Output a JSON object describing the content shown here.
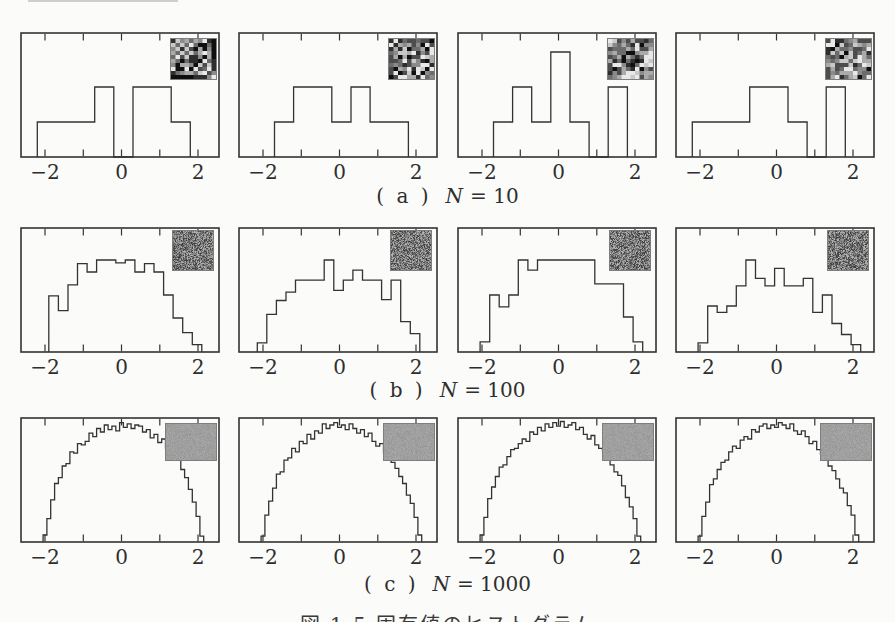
{
  "figure": {
    "paper_color": "#fbfbf9",
    "ink_color": "#333333",
    "bottom_caption": "図 1.5 固有値のヒストグラム"
  },
  "axis": {
    "x0_px": 101.5,
    "px_per_unit": 38.25,
    "ticks": [
      -2,
      -1,
      0,
      1,
      2
    ],
    "tick_labels": [
      {
        "value": -2,
        "text": "−2"
      },
      {
        "value": 0,
        "text": "0"
      },
      {
        "value": 2,
        "text": "2"
      }
    ],
    "xlim": [
      -2.65,
      2.57
    ]
  },
  "chart_data": [
    {
      "type": "bar",
      "row": "a",
      "title": "(a) N = 10",
      "caption": {
        "index": "( a )",
        "variable": "N",
        "value": "= 10"
      },
      "units": "eigenvalue count (histogram outline)",
      "bin_width": 0.5,
      "unit_px": 35,
      "top_px": 32,
      "inset": {
        "style": "matrix10",
        "w": 45,
        "h": 40,
        "right": 3,
        "top": 6
      },
      "panels": [
        {
          "start": -2.2,
          "heights": [
            1,
            1,
            1,
            2,
            0,
            2,
            2,
            1
          ],
          "seed": 101
        },
        {
          "start": -1.7,
          "heights": [
            1,
            2,
            2,
            1,
            2,
            1,
            1
          ],
          "seed": 202
        },
        {
          "start": -1.7,
          "heights": [
            1,
            2,
            1,
            3,
            1,
            0,
            2
          ],
          "seed": 303
        },
        {
          "start": -2.2,
          "heights": [
            1,
            1,
            1,
            2,
            2,
            1,
            0,
            2
          ],
          "seed": 404
        }
      ]
    },
    {
      "type": "bar",
      "row": "b",
      "title": "(b) N = 100",
      "caption": {
        "index": "( b )",
        "variable": "N",
        "value": "= 100"
      },
      "units": "relative count (max = 10)",
      "bin_width": 0.25,
      "unit_px": 9.2,
      "top_px": 227,
      "inset": {
        "style": "speckle",
        "w": 40,
        "h": 39,
        "right": 6,
        "top": 3
      },
      "panels": [
        {
          "start": -1.9,
          "heights": [
            6.1,
            4.5,
            7.3,
            9.6,
            8.7,
            10,
            10,
            9.7,
            10,
            8.7,
            9.6,
            8.7,
            6.2,
            3.7,
            2.1,
            0.8
          ],
          "seed": 511
        },
        {
          "start": -2.15,
          "heights": [
            1.0,
            4.1,
            5.6,
            6.5,
            7.8,
            7.8,
            7.8,
            10,
            6.7,
            7.8,
            8.9,
            7.8,
            7.8,
            5.7,
            7.8,
            3.3,
            2.0
          ],
          "seed": 522
        },
        {
          "start": -2.05,
          "heights": [
            1.1,
            6.2,
            4.9,
            6.2,
            10,
            8.9,
            10,
            10,
            10,
            10,
            10,
            10,
            7.4,
            7.4,
            7.4,
            3.8,
            1.1
          ],
          "seed": 533
        },
        {
          "start": -2.05,
          "heights": [
            1.0,
            5.0,
            4.3,
            5.0,
            7.2,
            10,
            8.0,
            7.2,
            9.1,
            7.2,
            7.2,
            8.0,
            4.3,
            6.2,
            3.1,
            1.9,
            0.8
          ],
          "seed": 544
        }
      ]
    },
    {
      "type": "bar",
      "row": "c",
      "title": "(c) N = 1000",
      "caption": {
        "index": "( c )",
        "variable": "N",
        "value": "= 1000"
      },
      "units": "relative density (semicircle law, max = 1)",
      "bin_width": 0.1,
      "unit_px": 117,
      "top_px": 417,
      "inset": {
        "style": "flat",
        "w": 50,
        "h": 36,
        "right": 3,
        "top": 6
      },
      "panels": [
        {
          "start": -2.05,
          "heights": [
            0.06,
            0.2,
            0.36,
            0.5,
            0.55,
            0.65,
            0.67,
            0.77,
            0.76,
            0.84,
            0.83,
            0.86,
            0.93,
            0.9,
            0.97,
            0.94,
            1.0,
            0.96,
            0.99,
            0.95,
            1.02,
            0.98,
            1.01,
            0.97,
            1.0,
            0.99,
            0.94,
            0.96,
            0.89,
            0.92,
            0.85,
            0.88,
            0.8,
            0.76,
            0.75,
            0.7,
            0.62,
            0.55,
            0.45,
            0.34,
            0.22,
            0.05
          ],
          "seed": 911
        },
        {
          "start": -2.05,
          "heights": [
            0.05,
            0.23,
            0.35,
            0.46,
            0.58,
            0.6,
            0.7,
            0.72,
            0.8,
            0.77,
            0.86,
            0.84,
            0.92,
            0.88,
            0.95,
            0.93,
            1.01,
            0.97,
            1.0,
            1.02,
            0.98,
            1.0,
            0.96,
            1.01,
            0.97,
            0.93,
            0.96,
            0.9,
            0.93,
            0.86,
            0.82,
            0.84,
            0.76,
            0.72,
            0.68,
            0.63,
            0.56,
            0.5,
            0.4,
            0.33,
            0.21,
            0.06
          ],
          "seed": 922
        },
        {
          "start": -2.05,
          "heights": [
            0.06,
            0.21,
            0.37,
            0.47,
            0.56,
            0.64,
            0.66,
            0.73,
            0.79,
            0.8,
            0.84,
            0.88,
            0.86,
            0.94,
            0.92,
            0.98,
            0.95,
            1.01,
            0.98,
            1.02,
            0.99,
            1.03,
            0.98,
            1.0,
            1.02,
            0.96,
            0.98,
            0.92,
            0.88,
            0.91,
            0.83,
            0.8,
            0.78,
            0.72,
            0.66,
            0.6,
            0.57,
            0.48,
            0.38,
            0.3,
            0.2,
            0.05
          ],
          "seed": 933
        },
        {
          "start": -2.05,
          "heights": [
            0.05,
            0.22,
            0.34,
            0.49,
            0.54,
            0.62,
            0.68,
            0.7,
            0.77,
            0.82,
            0.8,
            0.87,
            0.9,
            0.88,
            0.96,
            0.94,
            0.99,
            1.01,
            0.97,
            1.0,
            0.98,
            1.02,
            1.0,
            0.97,
            1.01,
            0.95,
            0.92,
            0.95,
            0.9,
            0.84,
            0.86,
            0.79,
            0.75,
            0.73,
            0.65,
            0.61,
            0.54,
            0.46,
            0.42,
            0.31,
            0.23,
            0.06
          ],
          "seed": 944
        }
      ]
    }
  ],
  "captions_layout": {
    "a_top": 184,
    "b_top": 378,
    "c_top": 572,
    "bottom_top": 609
  }
}
